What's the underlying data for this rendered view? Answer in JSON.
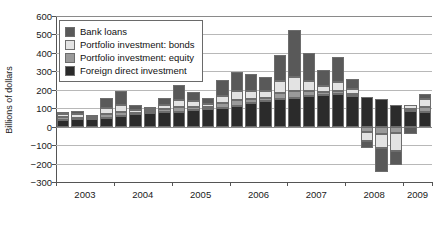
{
  "chart_data": {
    "type": "bar",
    "stacked": true,
    "title": "",
    "subtitle": "",
    "xlabel": "",
    "ylabel": "Billions of dollars",
    "ylim": [
      -300,
      600
    ],
    "ytick_values": [
      600,
      500,
      400,
      300,
      200,
      100,
      0,
      -100,
      -200,
      -300
    ],
    "ytick_labels": [
      "600",
      "500",
      "400",
      "300",
      "200",
      "100",
      "0",
      "−100",
      "−200",
      "−300"
    ],
    "xtick_labels": [
      "2003",
      "2004",
      "2005",
      "2006",
      "2007",
      "2008",
      "2009"
    ],
    "grid": true,
    "legend_position": "upper-left",
    "colors": {
      "bank_loans": "#595959",
      "portfolio_bonds": "#e3e3e3",
      "portfolio_equity": "#9a9a9a",
      "fdi": "#2b2b2b",
      "grid": "#b8b8b8",
      "axis": "#555555",
      "text": "#1a1a1a"
    },
    "categories": [
      "2003Q1",
      "2003Q2",
      "2003Q3",
      "2003Q4",
      "2004Q1",
      "2004Q2",
      "2004Q3",
      "2004Q4",
      "2005Q1",
      "2005Q2",
      "2005Q3",
      "2005Q4",
      "2006Q1",
      "2006Q2",
      "2006Q3",
      "2006Q4",
      "2007Q1",
      "2007Q2",
      "2007Q3",
      "2007Q4",
      "2008Q1",
      "2008Q2",
      "2008Q3",
      "2008Q4",
      "2009Q1",
      "2009Q2"
    ],
    "series": [
      {
        "name": "Foreign direct investment",
        "color": "#2b2b2b",
        "values": [
          38,
          40,
          42,
          48,
          60,
          66,
          72,
          78,
          82,
          90,
          96,
          100,
          112,
          126,
          140,
          150,
          158,
          168,
          172,
          176,
          168,
          160,
          150,
          120,
          86,
          78
        ]
      },
      {
        "name": "Portfolio investment: equity",
        "color": "#9a9a9a",
        "values": [
          14,
          8,
          6,
          18,
          22,
          10,
          14,
          16,
          24,
          18,
          10,
          26,
          30,
          22,
          16,
          34,
          38,
          26,
          14,
          20,
          10,
          -28,
          -40,
          -34,
          8,
          30
        ]
      },
      {
        "name": "Portfolio investment: bonds",
        "color": "#e3e3e3",
        "values": [
          16,
          22,
          10,
          34,
          38,
          14,
          8,
          24,
          40,
          30,
          18,
          42,
          52,
          46,
          38,
          62,
          74,
          54,
          36,
          48,
          26,
          -52,
          -78,
          -96,
          22,
          44
        ]
      },
      {
        "name": "Bank loans",
        "color": "#595959",
        "values": [
          10,
          14,
          6,
          56,
          74,
          28,
          14,
          40,
          78,
          52,
          30,
          86,
          104,
          92,
          76,
          140,
          252,
          152,
          84,
          136,
          54,
          -36,
          -130,
          -80,
          -42,
          26
        ]
      }
    ]
  },
  "legend": {
    "items": [
      {
        "label": "Bank loans",
        "color": "#595959"
      },
      {
        "label": "Portfolio investment: bonds",
        "color": "#e3e3e3"
      },
      {
        "label": "Portfolio investment: equity",
        "color": "#9a9a9a"
      },
      {
        "label": "Foreign direct investment",
        "color": "#2b2b2b"
      }
    ]
  }
}
